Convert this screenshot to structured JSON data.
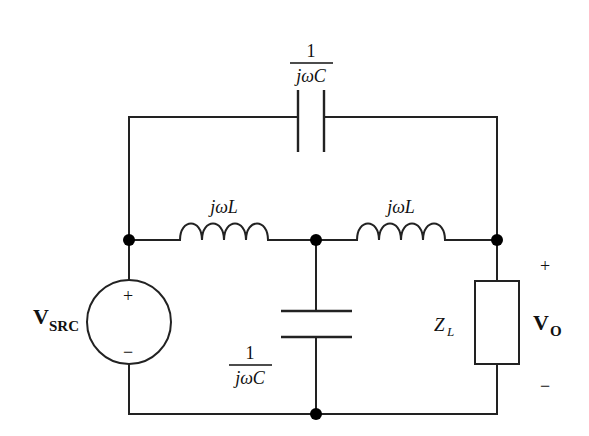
{
  "diagram": {
    "type": "circuit-schematic",
    "colors": {
      "line": "#222222",
      "node": "#000000",
      "background": "#ffffff"
    },
    "components": {
      "source": {
        "label_main": "V",
        "label_sub": "SRC",
        "plus": "+",
        "minus": "−"
      },
      "cap_top": {
        "label_num": "1",
        "label_den": "jωC"
      },
      "ind_left": {
        "label": "jωL"
      },
      "ind_right": {
        "label": "jωL"
      },
      "cap_mid": {
        "label_num": "1",
        "label_den": "jωC"
      },
      "load": {
        "label_main": "Z",
        "label_sub": "L"
      },
      "output": {
        "label_main": "V",
        "label_sub": "O",
        "plus": "+",
        "minus": "−"
      }
    },
    "nodes": [
      "left-node",
      "middle-node",
      "right-node",
      "bottom-node"
    ]
  }
}
